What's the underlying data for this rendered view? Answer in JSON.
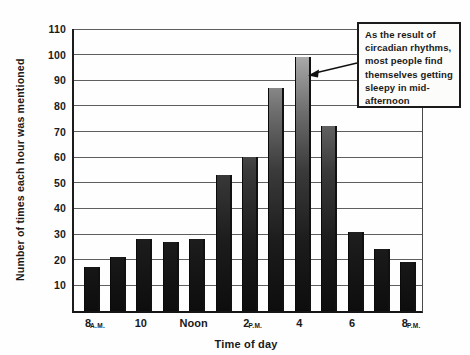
{
  "figure": {
    "y_axis_title": "Number of times each hour was mentioned",
    "x_axis_title": "Time of day"
  },
  "annotation": {
    "text": "As the result of\ncircadian rhythms,\nmost people find\nthemselves getting\nsleepy in mid-\nafternoon",
    "arrow_points_to": "peak bar at 4 P.M."
  },
  "chart_data": {
    "type": "bar",
    "categories": [
      "8 A.M.",
      "9 A.M.",
      "10 A.M.",
      "11 A.M.",
      "Noon",
      "1 P.M.",
      "2 P.M.",
      "3 P.M.",
      "4 P.M.",
      "5 P.M.",
      "6 P.M.",
      "7 P.M.",
      "8 P.M."
    ],
    "values": [
      17,
      21,
      28,
      27,
      28,
      53,
      60,
      87,
      99,
      72,
      31,
      24,
      19
    ],
    "title": "",
    "xlabel": "Time of day",
    "ylabel": "Number of times each hour was mentioned",
    "ylim": [
      0,
      110
    ],
    "y_ticks": [
      10,
      20,
      30,
      40,
      50,
      60,
      70,
      80,
      90,
      100,
      110
    ],
    "x_ticks": [
      {
        "index": 0,
        "main": "8",
        "suffix": "A.M."
      },
      {
        "index": 2,
        "main": "10",
        "suffix": ""
      },
      {
        "index": 4,
        "main": "Noon",
        "suffix": ""
      },
      {
        "index": 6,
        "main": "2",
        "suffix": "P.M."
      },
      {
        "index": 8,
        "main": "4",
        "suffix": ""
      },
      {
        "index": 10,
        "main": "6",
        "suffix": ""
      },
      {
        "index": 12,
        "main": "8",
        "suffix": "P.M."
      }
    ],
    "grid": true,
    "legend": false,
    "colors": {
      "bar_gradient_top": "#b2b2b2",
      "bar_gradient_bottom": "#0d0d0d",
      "gridline": "#5f5f5f",
      "axis": "#1c1c1c",
      "text": "#1a1a1a",
      "callout_border": "#1a1a1a",
      "callout_background": "#fcfcfa"
    }
  }
}
